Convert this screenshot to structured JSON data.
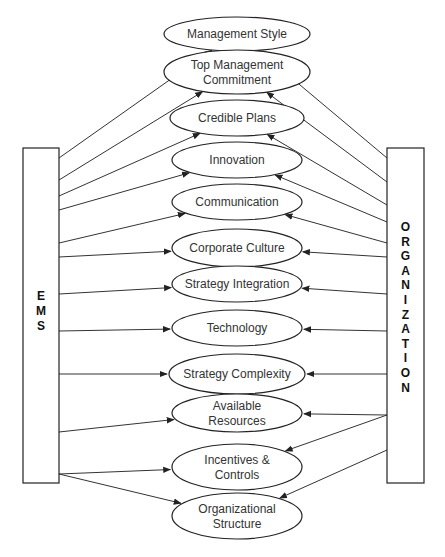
{
  "diagram": {
    "left_box": {
      "label": "EMS",
      "letters": [
        "E",
        "M",
        "S"
      ]
    },
    "right_box": {
      "label": "ORGANIZATION",
      "letters": [
        "O",
        "R",
        "G",
        "A",
        "N",
        "I",
        "Z",
        "A",
        "T",
        "I",
        "O",
        "N"
      ]
    },
    "factors": [
      {
        "id": "management-style",
        "lines": [
          "Management Style"
        ]
      },
      {
        "id": "top-management-commitment",
        "lines": [
          "Top Management",
          "Commitment"
        ]
      },
      {
        "id": "credible-plans",
        "lines": [
          "Credible Plans"
        ]
      },
      {
        "id": "innovation",
        "lines": [
          "Innovation"
        ]
      },
      {
        "id": "communication",
        "lines": [
          "Communication"
        ]
      },
      {
        "id": "corporate-culture",
        "lines": [
          "Corporate Culture"
        ]
      },
      {
        "id": "strategy-integration",
        "lines": [
          "Strategy Integration"
        ]
      },
      {
        "id": "technology",
        "lines": [
          "Technology"
        ]
      },
      {
        "id": "strategy-complexity",
        "lines": [
          "Strategy Complexity"
        ]
      },
      {
        "id": "available-resources",
        "lines": [
          "Available",
          "Resources"
        ]
      },
      {
        "id": "incentives-controls",
        "lines": [
          "Incentives &",
          "Controls"
        ]
      },
      {
        "id": "organizational-structure",
        "lines": [
          "Organizational",
          "Structure"
        ]
      }
    ],
    "edges_note": "Both EMS and ORGANIZATION have an arrow pointing to every factor",
    "colors": {
      "stroke": "#222222",
      "text": "#333333",
      "background": "#ffffff"
    }
  }
}
